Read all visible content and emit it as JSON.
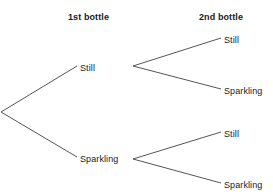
{
  "diagram": {
    "type": "probability-tree",
    "title": "",
    "background_color": "#ffffff",
    "line_color": "#555555",
    "text_color": "#222222",
    "headers": {
      "stage1": "1st bottle",
      "stage2": "2nd bottle"
    },
    "nodes": {
      "root": {
        "label": "",
        "x": 1,
        "y": 112
      },
      "level1": [
        {
          "id": "l1-still",
          "label": "Still",
          "x": 80,
          "y": 68
        },
        {
          "id": "l1-sparkling",
          "label": "Sparkling",
          "x": 80,
          "y": 159
        }
      ],
      "level2": [
        {
          "id": "l2-still-a",
          "label": "Still",
          "parent": "l1-still",
          "x": 224,
          "y": 40
        },
        {
          "id": "l2-sparkling-a",
          "label": "Sparkling",
          "parent": "l1-still",
          "x": 224,
          "y": 91
        },
        {
          "id": "l2-still-b",
          "label": "Still",
          "parent": "l1-sparkling",
          "x": 224,
          "y": 134
        },
        {
          "id": "l2-sparkling-b",
          "label": "Sparkling",
          "parent": "l1-sparkling",
          "x": 224,
          "y": 185
        }
      ]
    },
    "branches": [
      {
        "id": "root-to-still",
        "from": "root",
        "to": "l1-still",
        "x1": 1,
        "y1": 112,
        "x2": 77,
        "y2": 66
      },
      {
        "id": "root-to-sparkling",
        "from": "root",
        "to": "l1-sparkling",
        "x1": 1,
        "y1": 112,
        "x2": 77,
        "y2": 157
      },
      {
        "id": "still-to-still",
        "from": "l1-still",
        "to": "l2-still-a",
        "x1": 133,
        "y1": 66,
        "x2": 221,
        "y2": 38
      },
      {
        "id": "still-to-sparkling",
        "from": "l1-still",
        "to": "l2-sparkling-a",
        "x1": 133,
        "y1": 66,
        "x2": 221,
        "y2": 89
      },
      {
        "id": "sparkling-to-still",
        "from": "l1-sparkling",
        "to": "l2-still-b",
        "x1": 133,
        "y1": 159,
        "x2": 221,
        "y2": 132
      },
      {
        "id": "sparkling-to-sparkling",
        "from": "l1-sparkling",
        "to": "l2-sparkling-b",
        "x1": 133,
        "y1": 159,
        "x2": 221,
        "y2": 183
      }
    ]
  }
}
